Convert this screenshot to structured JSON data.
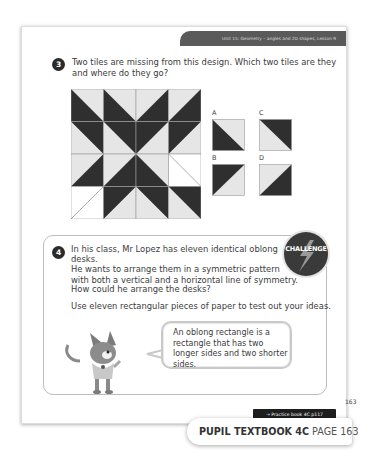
{
  "header": {
    "unit_title": "Unit 15: Geometry – angles and 2D shapes, Lesson 9"
  },
  "question3": {
    "number": "3",
    "text_line1": "Two tiles are missing from this design. Which two tiles are they",
    "text_line2": "and where do they go?",
    "grid": {
      "rows": 4,
      "cols": 4,
      "cells": [
        [
          "dark-bottom-left",
          "dark-bottom-left",
          "dark-bottom-right",
          "dark-bottom-right"
        ],
        [
          "dark-top-right",
          "dark-top-right",
          "dark-top-left",
          "dark-top-left"
        ],
        [
          "dark-bottom-right",
          "dark-bottom-right",
          "dark-bottom-left",
          "missing-diag-down"
        ],
        [
          "missing-diag-up",
          "dark-top-left",
          "dark-top-right",
          "dark-top-right"
        ]
      ]
    },
    "tile_options": [
      {
        "label": "A",
        "type": "dark-bottom-left"
      },
      {
        "label": "B",
        "type": "dark-top-left"
      },
      {
        "label": "C",
        "type": "dark-top-right"
      },
      {
        "label": "D",
        "type": "dark-bottom-right"
      }
    ]
  },
  "question4": {
    "number": "4",
    "badge": "CHALLENGE",
    "para1_line1": "In his class, Mr Lopez has eleven identical oblong desks.",
    "para1_line2": "He wants to arrange them in a symmetric pattern",
    "para1_line3": "with both a vertical and a horizontal line of symmetry.",
    "para2": "How could he arrange the desks?",
    "para3": "Use eleven rectangular pieces of paper to test out your ideas.",
    "speech_bubble": "An oblong rectangle is a rectangle that has two longer sides and two shorter sides."
  },
  "footer": {
    "practice_link": "→ Practice book 4C p117",
    "page_number": "163",
    "book_label": "PUPIL TEXTBOOK 4C",
    "page_label": "PAGE 163"
  },
  "colors": {
    "dark_tile": "#2f2f2f",
    "light_tile": "#e6e6e6",
    "header_bar": "#5a5a5a"
  }
}
